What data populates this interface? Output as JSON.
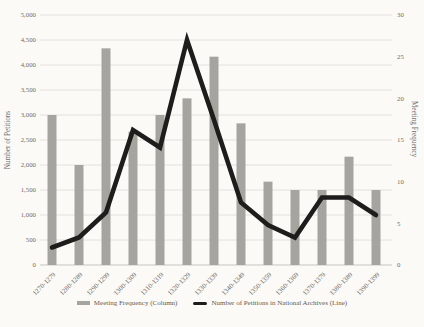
{
  "chart_data": {
    "type": "bar",
    "title": "",
    "categories": [
      "1270-1279",
      "1280-1289",
      "1290-1299",
      "1300-1309",
      "1310-1319",
      "1320-1329",
      "1330-1339",
      "1340-1349",
      "1350-1359",
      "1360-1369",
      "1370-1379",
      "1380-1389",
      "1390-1399"
    ],
    "series": [
      {
        "name": "Meeting Frequency (Column)",
        "render": "column",
        "axis": "right",
        "color": "#a6a49f",
        "values": [
          18,
          12,
          26,
          16,
          18,
          20,
          25,
          17,
          10,
          9,
          9,
          13,
          9
        ]
      },
      {
        "name": "Number of Petitions in National Archives (Line)",
        "render": "line",
        "axis": "left",
        "color": "#1e1d1b",
        "values": [
          350,
          550,
          1050,
          2700,
          2350,
          4500,
          2900,
          1250,
          800,
          550,
          1350,
          1350,
          1000
        ]
      }
    ],
    "left_axis": {
      "label": "Number of Petitions",
      "min": 0,
      "max": 5000,
      "step": 500,
      "ticks": [
        "0",
        "500",
        "1,000",
        "1,500",
        "2,000",
        "2,500",
        "3,000",
        "3,500",
        "4,000",
        "4,500",
        "5,000"
      ]
    },
    "right_axis": {
      "label": "Meeting Frequency",
      "min": 0,
      "max": 30,
      "step": 5,
      "ticks": [
        "0",
        "5",
        "10",
        "15",
        "20",
        "25",
        "30"
      ]
    },
    "grid": true,
    "legend_position": "bottom"
  },
  "colors": {
    "grid": "#dedbd5",
    "axis_line": "#c9c6c0",
    "tick_text": "#6f6c66",
    "background": "#fbfaf7"
  }
}
